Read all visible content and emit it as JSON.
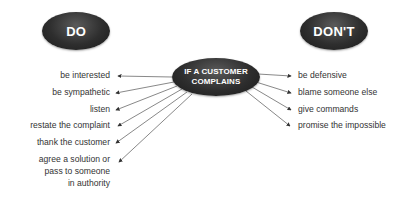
{
  "diagram": {
    "do_label": "DO",
    "dont_label": "DON'T",
    "center_label_line1": "IF A CUSTOMER",
    "center_label_line2": "COMPLAINS",
    "do_items": [
      "be interested",
      "be sympathetic",
      "listen",
      "restate the complaint",
      "thank the customer",
      "agree a solution or",
      "pass to someone",
      "in authority"
    ],
    "dont_items": [
      "be defensive",
      "blame someone else",
      "give commands",
      "promise the impossible"
    ],
    "colors": {
      "oval": "#2e2e2e",
      "text": "#333333",
      "lines": "#444444"
    }
  }
}
